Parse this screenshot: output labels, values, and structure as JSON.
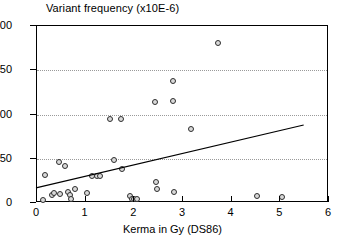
{
  "chart_data": {
    "type": "scatter",
    "title": "Variant frequency (x10E-6)",
    "xlabel": "Kerma in Gy (DS86)",
    "ylabel": "Variant frequency (x10E-6)",
    "xlim": [
      0,
      6
    ],
    "ylim": [
      0,
      200
    ],
    "xticks": [
      0,
      1,
      2,
      3,
      4,
      5,
      6
    ],
    "yticks": [
      0,
      50,
      100,
      150,
      200
    ],
    "xtick_labels": [
      "0",
      "1",
      "2",
      "3",
      "4",
      "5",
      "6"
    ],
    "ytick_labels": [
      "0",
      "50",
      "100",
      "150",
      "200"
    ],
    "grid": "horizontal-dotted",
    "legend": null,
    "points": [
      {
        "x": 0.13,
        "y": 3
      },
      {
        "x": 0.16,
        "y": 32
      },
      {
        "x": 0.3,
        "y": 9
      },
      {
        "x": 0.34,
        "y": 11
      },
      {
        "x": 0.45,
        "y": 46
      },
      {
        "x": 0.48,
        "y": 10
      },
      {
        "x": 0.58,
        "y": 42
      },
      {
        "x": 0.63,
        "y": 12
      },
      {
        "x": 0.67,
        "y": 9
      },
      {
        "x": 0.69,
        "y": 5
      },
      {
        "x": 0.79,
        "y": 16
      },
      {
        "x": 1.02,
        "y": 11
      },
      {
        "x": 1.14,
        "y": 31
      },
      {
        "x": 1.24,
        "y": 31
      },
      {
        "x": 1.29,
        "y": 31
      },
      {
        "x": 1.5,
        "y": 95
      },
      {
        "x": 1.59,
        "y": 49
      },
      {
        "x": 1.73,
        "y": 95
      },
      {
        "x": 1.75,
        "y": 38
      },
      {
        "x": 1.92,
        "y": 8
      },
      {
        "x": 1.95,
        "y": 5
      },
      {
        "x": 2.0,
        "y": 4
      },
      {
        "x": 2.05,
        "y": 4
      },
      {
        "x": 2.42,
        "y": 114
      },
      {
        "x": 2.44,
        "y": 24
      },
      {
        "x": 2.47,
        "y": 16
      },
      {
        "x": 2.79,
        "y": 138
      },
      {
        "x": 2.8,
        "y": 115
      },
      {
        "x": 2.82,
        "y": 12
      },
      {
        "x": 3.17,
        "y": 84
      },
      {
        "x": 3.72,
        "y": 181
      },
      {
        "x": 4.52,
        "y": 8
      },
      {
        "x": 5.03,
        "y": 7
      }
    ],
    "fit_line": {
      "x_start": 0.0,
      "y_start": 16,
      "x_end": 5.5,
      "y_end": 87,
      "style": "solid"
    }
  }
}
